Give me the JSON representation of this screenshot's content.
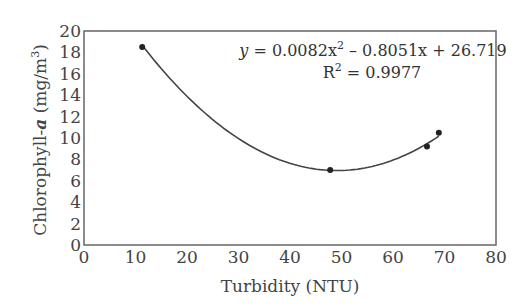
{
  "chart_data": {
    "type": "scatter",
    "title": "",
    "xlabel": "Turbidity (NTU)",
    "ylabel": "Chlorophyll-a (mg/m3)",
    "xlim": [
      0,
      80
    ],
    "ylim": [
      0,
      20
    ],
    "xticks": [
      0,
      10,
      20,
      30,
      40,
      50,
      60,
      70,
      80
    ],
    "yticks": [
      0,
      2,
      4,
      6,
      8,
      10,
      12,
      14,
      16,
      18,
      20
    ],
    "grid": false,
    "legend": null,
    "series": [
      {
        "name": "Observations",
        "x": [
          11.3,
          47.8,
          66.6,
          68.9
        ],
        "y": [
          18.5,
          7.0,
          9.2,
          10.5
        ]
      }
    ],
    "trendline": {
      "type": "polynomial",
      "order": 2,
      "coefficients": [
        0.0082,
        -0.8051,
        26.719
      ],
      "x_range": [
        11.3,
        68.9
      ],
      "equation": "y = 0.0082x2 – 0.8051x + 26.719",
      "r_squared": 0.9977
    },
    "annotations": [
      "y = 0.0082x² – 0.8051x + 26.719",
      "R² = 0.9977"
    ]
  },
  "labels": {
    "xlabel": "Turbidity (NTU)",
    "ylabel_main": "Chlorophyll-",
    "ylabel_italic": "a",
    "ylabel_unit": " (mg/m",
    "ylabel_sup": "3",
    "ylabel_close": ")",
    "eq_y": "y",
    "eq_body": " = 0.0082x",
    "eq_sup": "2",
    "eq_rest": " – 0.8051x + 26.719",
    "r2_R": "R",
    "r2_sup": "2",
    "r2_rest": " = 0.9977"
  }
}
